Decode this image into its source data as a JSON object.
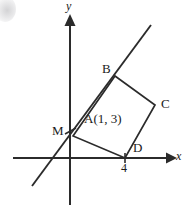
{
  "figure": {
    "background_color": "#ffffff",
    "stroke_color": "#2b2b2b",
    "width": 194,
    "height": 211
  },
  "axes": {
    "x_label": "x",
    "y_label": "y",
    "origin_px": [
      70,
      158
    ],
    "x_axis_px": {
      "x1": 13,
      "y1": 158,
      "x2": 172,
      "y2": 158
    },
    "y_axis_px": {
      "x1": 70,
      "y1": 205,
      "x2": 70,
      "y2": 20
    },
    "x_arrow": true,
    "y_arrow": true,
    "grid": false
  },
  "ticks": [
    {
      "name": "x-tick-4",
      "label": "4",
      "axis": "x",
      "value": 4,
      "px": [
        125,
        158
      ]
    }
  ],
  "points": [
    {
      "name": "A",
      "label": "A",
      "coord_label": "(1, 3)",
      "full_label": "A(1, 3)",
      "px": [
        73,
        136
      ]
    },
    {
      "name": "B",
      "label": "B",
      "coord_label": "",
      "full_label": "B",
      "px": [
        115,
        76
      ]
    },
    {
      "name": "C",
      "label": "C",
      "coord_label": "",
      "full_label": "C",
      "px": [
        155,
        105
      ]
    },
    {
      "name": "D",
      "label": "D",
      "coord_label": "",
      "full_label": "D",
      "px": [
        125,
        158
      ]
    },
    {
      "name": "M",
      "label": "M",
      "coord_label": "",
      "full_label": "M",
      "px": [
        70,
        131
      ]
    }
  ],
  "shapes": {
    "square": {
      "name": "square-ABCD",
      "vertices": [
        "A",
        "B",
        "C",
        "D"
      ],
      "points_px": "73,136 115,76 155,105 125,158"
    },
    "line": {
      "name": "line-through-M-A-B",
      "description": "straight line crossing the y-axis at M and passing through A and B",
      "x1": 32,
      "y1": 186,
      "x2": 150,
      "y2": 26
    }
  },
  "marks": [
    {
      "name": "m-tick-mark",
      "type": "tick",
      "px": [
        70,
        131
      ]
    },
    {
      "name": "d-tick-mark",
      "type": "tick",
      "px": [
        125,
        158
      ]
    }
  ],
  "artifacts": [
    {
      "name": "scan-smudge",
      "type": "gray-blob",
      "px": [
        -6,
        -4
      ]
    }
  ]
}
